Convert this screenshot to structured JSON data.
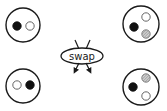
{
  "diagram": {
    "label": "swap",
    "colors": {
      "stroke": "#1a1a1a",
      "black": "#111111",
      "white": "#ffffff",
      "hatch": "#888888"
    },
    "states": [
      {
        "id": "top-left",
        "cx": 23,
        "cy": 25,
        "r": 17,
        "dots": [
          {
            "kind": "black",
            "cx": 17,
            "cy": 26
          },
          {
            "kind": "white",
            "cx": 30,
            "cy": 26
          }
        ]
      },
      {
        "id": "top-right",
        "cx": 141,
        "cy": 24,
        "r": 18,
        "dots": [
          {
            "kind": "black",
            "cx": 134,
            "cy": 27
          },
          {
            "kind": "white",
            "cx": 146,
            "cy": 17
          },
          {
            "kind": "hatch",
            "cx": 146,
            "cy": 34
          }
        ]
      },
      {
        "id": "bottom-left",
        "cx": 23,
        "cy": 86,
        "r": 17,
        "dots": [
          {
            "kind": "white",
            "cx": 17,
            "cy": 85
          },
          {
            "kind": "black",
            "cx": 30,
            "cy": 85
          }
        ]
      },
      {
        "id": "bottom-right",
        "cx": 141,
        "cy": 87,
        "r": 18,
        "dots": [
          {
            "kind": "black",
            "cx": 133,
            "cy": 87
          },
          {
            "kind": "hatch",
            "cx": 146,
            "cy": 78
          },
          {
            "kind": "white",
            "cx": 146,
            "cy": 96
          }
        ]
      }
    ]
  }
}
